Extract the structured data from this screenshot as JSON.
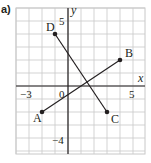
{
  "part_label": "a)",
  "grid": {
    "x_min": -4,
    "x_max": 6,
    "y_min": -5,
    "y_max": 6,
    "origin_px": [
      68,
      86
    ],
    "unit_px": 13,
    "grid_color": "#c8c8c8",
    "axis_color": "#231f20"
  },
  "axes": {
    "x_label": "x",
    "y_label": "y",
    "origin_label": "0",
    "ticks": [
      {
        "axis": "x",
        "value": -3,
        "label": "−3"
      },
      {
        "axis": "x",
        "value": 5,
        "label": "5"
      },
      {
        "axis": "y",
        "value": 5,
        "label": "5"
      },
      {
        "axis": "y",
        "value": -4,
        "label": "−4"
      }
    ]
  },
  "points": [
    {
      "name": "A",
      "x": -2,
      "y": -2
    },
    {
      "name": "B",
      "x": 4,
      "y": 2
    },
    {
      "name": "C",
      "x": 3,
      "y": -2
    },
    {
      "name": "D",
      "x": -1,
      "y": 4
    }
  ],
  "segments": [
    {
      "from": "A",
      "to": "B"
    },
    {
      "from": "D",
      "to": "C"
    }
  ]
}
